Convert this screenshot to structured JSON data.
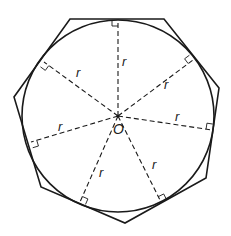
{
  "diagram": {
    "center": {
      "label": "O",
      "x": 118,
      "y": 116
    },
    "circle_radius_px": 96,
    "radius_label": "r",
    "polygon_vertices": [
      [
        70,
        19
      ],
      [
        164,
        19
      ],
      [
        219,
        88
      ],
      [
        206,
        178
      ],
      [
        125,
        223
      ],
      [
        41,
        187
      ],
      [
        14,
        97
      ]
    ],
    "tangent_points": [
      {
        "x": 118,
        "y": 20,
        "label": "r",
        "label_pos": [
          122,
          66
        ]
      },
      {
        "x": 193,
        "y": 60,
        "label": "r",
        "label_pos": [
          164,
          89
        ]
      },
      {
        "x": 212,
        "y": 130,
        "label": "r",
        "label_pos": [
          175,
          121
        ]
      },
      {
        "x": 161,
        "y": 202,
        "label": "r",
        "label_pos": [
          152,
          169
        ]
      },
      {
        "x": 80,
        "y": 202,
        "label": "r",
        "label_pos": [
          99,
          177
        ]
      },
      {
        "x": 31,
        "y": 142,
        "label": "r",
        "label_pos": [
          58,
          131
        ]
      },
      {
        "x": 44,
        "y": 62,
        "label": "r",
        "label_pos": [
          76,
          77
        ]
      }
    ],
    "stroke_color": "#1a1a1a",
    "background": "#ffffff"
  }
}
